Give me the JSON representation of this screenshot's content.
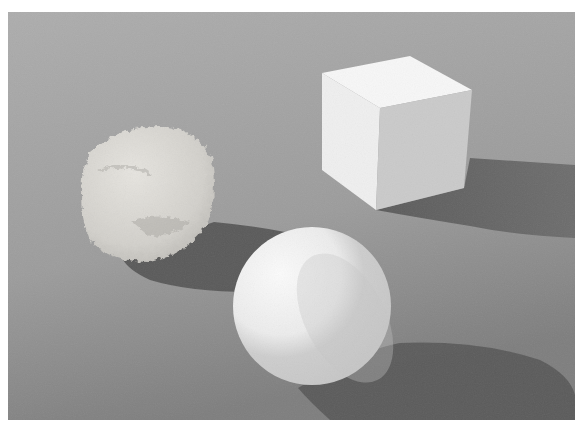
{
  "scene": {
    "description": "3D render of three white objects on a gray floor: a rough rock, a cube, and a sphere, each casting a shadow",
    "objects": [
      {
        "name": "rock",
        "shape": "irregular rough rock"
      },
      {
        "name": "cube",
        "shape": "cube"
      },
      {
        "name": "sphere",
        "shape": "sphere"
      }
    ],
    "colors": {
      "floor_top": "#acacac",
      "floor_bottom": "#8c8c8c",
      "shadow": "#5e5e5e",
      "object_light": "#f4f4f4",
      "object_mid": "#cfcfcf",
      "object_dark": "#b8b8b8"
    }
  }
}
